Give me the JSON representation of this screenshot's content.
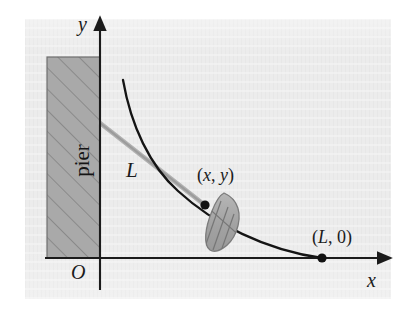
{
  "figure": {
    "kind": "math-diagram",
    "background_color": "#ececec",
    "ink_color": "#1b1b1b",
    "rope_color": "#9a9a9a",
    "pier_fill": "#a8a8a8",
    "boat_fill": "#a6a6a6"
  },
  "axes": {
    "y_label": "y",
    "x_label": "x",
    "origin_label": "O",
    "x_axis": {
      "y": 258,
      "x_start": 45,
      "x_end": 385,
      "arrow": "right"
    },
    "y_axis": {
      "x": 100,
      "y_start": 290,
      "y_end": 22,
      "arrow": "up"
    }
  },
  "pier": {
    "label": "pier",
    "label_rotation_deg": -90,
    "rect": {
      "x": 47,
      "y": 57,
      "width": 53,
      "height": 201
    },
    "hatch": {
      "angle_deg": 45,
      "spacing_px": 15
    }
  },
  "rope": {
    "label": "L",
    "from": {
      "x": 100,
      "y": 123
    },
    "to": {
      "x": 205,
      "y": 205
    }
  },
  "curve": {
    "name": "tractrix",
    "start": {
      "x": 123,
      "y": 80
    },
    "end": {
      "x": 322,
      "y": 258
    },
    "path": "M123,80 C131,126 150,166 178,191 C214,224 265,250 322,258"
  },
  "points": [
    {
      "name": "boat-position",
      "label": "(x, y)",
      "x": 205,
      "y": 205
    },
    {
      "name": "dock-end",
      "label": "(L, 0)",
      "x": 322,
      "y": 258
    }
  ],
  "boat": {
    "name": "boat",
    "center": {
      "x": 224,
      "y": 224
    },
    "length": 62,
    "width": 27,
    "rotation_deg": 40,
    "thwart_count": 5
  },
  "labels": {
    "y": "y",
    "x": "x",
    "origin": "O",
    "rope": "L",
    "boat_point_open": "(",
    "boat_point_x": "x",
    "boat_point_comma": ", ",
    "boat_point_y": "y",
    "boat_point_close": ")",
    "dock_open": "(",
    "dock_L": "L",
    "dock_comma": ", 0)",
    "pier": "pier"
  }
}
